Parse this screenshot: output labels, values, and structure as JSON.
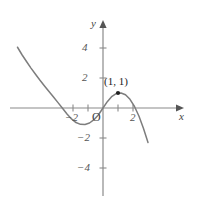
{
  "figure": {
    "width": 198,
    "height": 202,
    "background": "#ffffff"
  },
  "axes": {
    "x_axis_label": "x",
    "y_axis_label": "y",
    "origin_label": "O",
    "axis_color": "#8a8a8a",
    "origin_px": {
      "x": 103,
      "y": 108
    },
    "unit_px": 15,
    "x_ticks": [
      {
        "value": -2,
        "label": "−2",
        "show_label": true
      },
      {
        "value": -1,
        "label": "",
        "show_label": false
      },
      {
        "value": 1,
        "label": "",
        "show_label": false
      },
      {
        "value": 2,
        "label": "2",
        "show_label": true
      }
    ],
    "y_ticks": [
      {
        "value": 4,
        "label": "4",
        "show_label": true
      },
      {
        "value": 2,
        "label": "2",
        "show_label": true
      },
      {
        "value": -2,
        "label": "−2",
        "show_label": true
      },
      {
        "value": -4,
        "label": "−4",
        "show_label": true
      }
    ]
  },
  "chart_data": {
    "type": "line",
    "title": "",
    "subtitle": "",
    "xlabel": "x",
    "ylabel": "y",
    "xlim": [
      -5.7,
      5.7
    ],
    "ylim": [
      -5.9,
      5.2
    ],
    "grid": false,
    "legend": null,
    "curve_color": "#7d7d7d",
    "series": [
      {
        "name": "curve",
        "x": [
          -5.7,
          -5.4,
          -5.1,
          -4.8,
          -4.5,
          -4.2,
          -3.9,
          -3.6,
          -3.3,
          -3.0,
          -2.7,
          -2.4,
          -2.1,
          -1.8,
          -1.5,
          -1.2,
          -0.9,
          -0.6,
          -0.3,
          0.0,
          0.3,
          0.6,
          0.9,
          1.2,
          1.5,
          1.8,
          2.1,
          2.4,
          2.7,
          3.0
        ],
        "y": [
          4.05,
          3.55,
          3.1,
          2.66,
          2.25,
          1.85,
          1.47,
          1.1,
          0.73,
          0.36,
          -0.02,
          -0.4,
          -0.73,
          -0.97,
          -1.09,
          -1.1,
          -1.0,
          -0.78,
          -0.45,
          0.0,
          0.44,
          0.78,
          0.98,
          1.0,
          0.88,
          0.58,
          0.1,
          -0.55,
          -1.36,
          -2.3
        ]
      }
    ],
    "annotations": [
      {
        "label": "(1, 1)",
        "point": {
          "x": 1,
          "y": 1
        },
        "marker": "dot",
        "marker_color": "#222222",
        "label_offset_px": {
          "x": 0,
          "y": -14
        }
      }
    ]
  },
  "tick_labels": {
    "x_neg2": "−2",
    "x_pos2": "2",
    "y_pos4": "4",
    "y_pos2": "2",
    "y_neg2": "−2",
    "y_neg4": "−4"
  },
  "labels": {
    "origin": "O",
    "x_axis": "x",
    "y_axis": "y",
    "point_annotation": "(1, 1)"
  }
}
